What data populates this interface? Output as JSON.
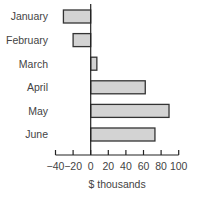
{
  "chart_data": {
    "type": "bar",
    "orientation": "horizontal",
    "title": "",
    "categories": [
      "January",
      "February",
      "March",
      "April",
      "May",
      "June"
    ],
    "values": [
      -31,
      -20,
      7,
      62,
      89,
      73
    ],
    "xlabel": "$ thousands",
    "ylabel": "",
    "xlim": [
      -40,
      100
    ],
    "xticks": [
      -40,
      -20,
      0,
      20,
      40,
      60,
      80,
      100
    ],
    "xtick_labels": [
      "−40",
      "−20",
      "0",
      "20",
      "40",
      "60",
      "80",
      "100"
    ],
    "grid": false,
    "legend": null,
    "bar_fill": "#d3d3d3",
    "bar_stroke": "#333333"
  }
}
